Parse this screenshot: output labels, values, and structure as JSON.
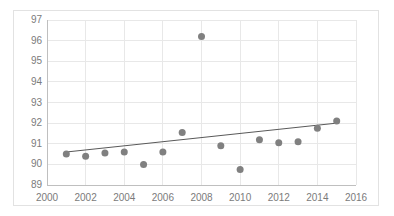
{
  "chart_data": {
    "type": "scatter",
    "title": "",
    "xlabel": "",
    "ylabel": "",
    "xlim": [
      2000,
      2016
    ],
    "ylim": [
      89,
      97
    ],
    "xticks": [
      2000,
      2002,
      2004,
      2006,
      2008,
      2010,
      2012,
      2014,
      2016
    ],
    "xtick_labels": [
      "2000",
      "2002",
      "2004",
      "2006",
      "2008",
      "2010",
      "2012",
      "2014",
      "2016"
    ],
    "yticks": [
      89,
      90,
      91,
      92,
      93,
      94,
      95,
      96,
      97
    ],
    "ytick_labels": [
      "89",
      "90",
      "91",
      "92",
      "93",
      "94",
      "95",
      "96",
      "97"
    ],
    "grid": true,
    "grid_axis": "both",
    "legend": false,
    "legend_position": "none",
    "series": [
      {
        "name": "data",
        "marker": "circle",
        "marker_color": "#808080",
        "marker_size": 7,
        "x": [
          2001,
          2002,
          2003,
          2004,
          2005,
          2006,
          2007,
          2008,
          2009,
          2010,
          2011,
          2012,
          2013,
          2014,
          2015
        ],
        "y": [
          90.5,
          90.4,
          90.55,
          90.6,
          90.0,
          90.6,
          91.55,
          96.2,
          90.9,
          89.75,
          91.2,
          91.05,
          91.1,
          91.75,
          92.1
        ]
      },
      {
        "name": "linear-trendline",
        "type": "line",
        "line_color": "#595959",
        "line_width": 1,
        "x": [
          2001,
          2015
        ],
        "y": [
          90.6,
          92.0
        ]
      }
    ],
    "colors": {
      "marker": "#808080",
      "trendline": "#595959",
      "grid": "#e8e8e8",
      "axis": "#bfbfbf",
      "tick_text": "#7b7b7b",
      "frame_border": "#e2e2e2",
      "background": "#ffffff"
    }
  }
}
